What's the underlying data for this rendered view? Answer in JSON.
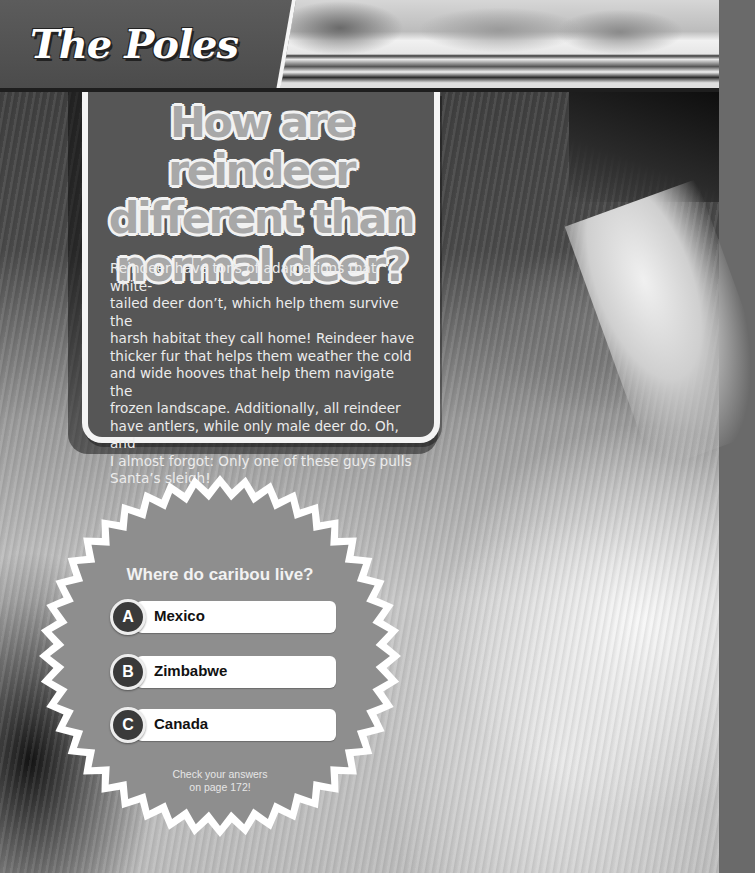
{
  "header": {
    "section_title": "The Poles",
    "banner_image": "arctic-mountains-glacier-photo"
  },
  "background": {
    "image": "reindeer-fur-closeup-photo"
  },
  "info_card": {
    "title_lines": [
      "How are reindeer",
      "different than",
      "normal deer?"
    ],
    "body_lines": [
      "Reindeer have tons of adaptations that white-",
      "tailed deer don’t, which help them survive the",
      "harsh habitat they call home! Reindeer have",
      "thicker fur that helps them weather the cold",
      "and wide hooves that help them navigate the",
      "frozen landscape. Additionally, all reindeer",
      "have antlers, while only male deer do. Oh, and",
      "I almost forgot: Only one of these guys pulls",
      "Santa’s sleigh!"
    ]
  },
  "quiz": {
    "question": "Where do caribou live?",
    "answers": [
      {
        "letter": "A",
        "text": "Mexico"
      },
      {
        "letter": "B",
        "text": "Zimbabwe"
      },
      {
        "letter": "C",
        "text": "Canada"
      }
    ],
    "note_lines": [
      "Check your answers",
      "on page 172!"
    ]
  },
  "colors": {
    "card_fill": "#565656",
    "card_border": "#f4f4f4",
    "title_fill": "#a8a8a8",
    "badge_fill": "#8e8e8e",
    "badge_border": "#ffffff",
    "answer_circle": "#3a3a3a"
  }
}
